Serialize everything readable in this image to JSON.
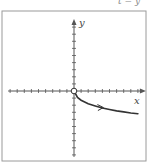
{
  "header": {
    "clipped_text": "t = y"
  },
  "chart_data": {
    "type": "line",
    "title": "",
    "xlabel": "x",
    "ylabel": "y",
    "grid": false,
    "xlim": [
      -9,
      9
    ],
    "ylim": [
      -9,
      9
    ],
    "x_ticks_count_each_side": 9,
    "y_ticks_count_each_side": 9,
    "series": [
      {
        "name": "parametric curve",
        "start_point": {
          "x": 0,
          "y": 0,
          "marker": "open-circle"
        },
        "direction_arrow": "increasing x",
        "x": [
          0,
          0.5,
          1,
          2,
          3,
          4,
          5,
          6,
          7,
          8,
          9
        ],
        "y": [
          0,
          -0.9,
          -1.3,
          -1.8,
          -2.1,
          -2.4,
          -2.6,
          -2.8,
          -2.95,
          -3.1,
          -3.2
        ]
      }
    ]
  },
  "style": {
    "axis_color": "#555555",
    "curve_color": "#333333",
    "frame_color": "#999999"
  }
}
